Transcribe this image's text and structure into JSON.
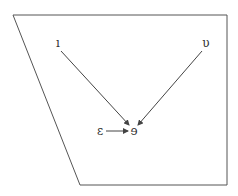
{
  "diagram": {
    "frame": {
      "points": [
        [
          13,
          15
        ],
        [
          227,
          15
        ],
        [
          227,
          185
        ],
        [
          80,
          185
        ]
      ],
      "stroke": "#555555"
    },
    "nodes": [
      {
        "id": "n1",
        "label": "ı",
        "x": 58,
        "y": 47
      },
      {
        "id": "n2",
        "label": "υ",
        "x": 206,
        "y": 47
      },
      {
        "id": "n3",
        "label": "ɛ",
        "x": 100,
        "y": 135
      },
      {
        "id": "n4",
        "label": "ɘ",
        "x": 134,
        "y": 135
      }
    ],
    "edges": [
      {
        "from": "n1",
        "to": "n4",
        "x1": 61,
        "y1": 51,
        "x2": 129,
        "y2": 125
      },
      {
        "from": "n2",
        "to": "n4",
        "x1": 202,
        "y1": 51,
        "x2": 138,
        "y2": 125
      },
      {
        "from": "n3",
        "to": "n4",
        "x1": 106,
        "y1": 131,
        "x2": 128,
        "y2": 131
      }
    ],
    "line_color": "#444444"
  }
}
